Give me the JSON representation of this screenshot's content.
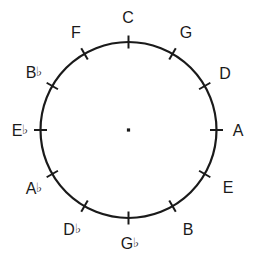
{
  "diagram": {
    "shape": "circle",
    "center_marker": "center-dot",
    "stroke_color": "#1a1a1a",
    "text_color": "#1a1a1a",
    "background_color": "#ffffff",
    "circle": {
      "cx": 128.5,
      "cy": 130,
      "r": 88,
      "stroke_width": 2.2
    },
    "tick_count": 12,
    "tick_length": 13,
    "positions": [
      {
        "id": "note-c",
        "note": "C",
        "accidental": "",
        "angle_deg": 0,
        "label_x": 128,
        "label_y": 18
      },
      {
        "id": "note-g",
        "note": "G",
        "accidental": "",
        "angle_deg": 30,
        "label_x": 186,
        "label_y": 33
      },
      {
        "id": "note-d",
        "note": "D",
        "accidental": "",
        "angle_deg": 60,
        "label_x": 225,
        "label_y": 74
      },
      {
        "id": "note-a",
        "note": "A",
        "accidental": "",
        "angle_deg": 90,
        "label_x": 238,
        "label_y": 131
      },
      {
        "id": "note-e",
        "note": "E",
        "accidental": "",
        "angle_deg": 120,
        "label_x": 228,
        "label_y": 188
      },
      {
        "id": "note-b",
        "note": "B",
        "accidental": "",
        "angle_deg": 150,
        "label_x": 188,
        "label_y": 230
      },
      {
        "id": "note-g-flat",
        "note": "G",
        "accidental": "♭",
        "angle_deg": 180,
        "label_x": 130,
        "label_y": 244
      },
      {
        "id": "note-d-flat",
        "note": "D",
        "accidental": "♭",
        "angle_deg": 210,
        "label_x": 72,
        "label_y": 230
      },
      {
        "id": "note-a-flat",
        "note": "A",
        "accidental": "♭",
        "angle_deg": 240,
        "label_x": 34,
        "label_y": 189
      },
      {
        "id": "note-e-flat",
        "note": "E",
        "accidental": "♭",
        "angle_deg": 270,
        "label_x": 20,
        "label_y": 131
      },
      {
        "id": "note-b-flat",
        "note": "B",
        "accidental": "♭",
        "angle_deg": 300,
        "label_x": 34,
        "label_y": 73
      },
      {
        "id": "note-f",
        "note": "F",
        "accidental": "",
        "angle_deg": 330,
        "label_x": 76,
        "label_y": 33
      }
    ]
  }
}
